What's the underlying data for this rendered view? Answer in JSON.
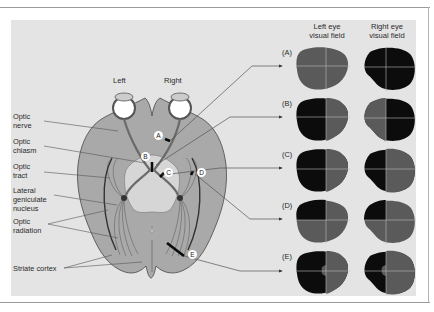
{
  "diagram": {
    "type": "visual pathway lesions and visual field defects",
    "side_labels": {
      "left": "Left",
      "right": "Right"
    },
    "column_headers": {
      "left_eye": "Left eye\nvisual field",
      "right_eye": "Right eye\nvisual field"
    },
    "structure_labels": [
      {
        "id": "optic-nerve",
        "text": "Optic\nnerve"
      },
      {
        "id": "optic-chiasm",
        "text": "Optic\nchiasm"
      },
      {
        "id": "optic-tract",
        "text": "Optic\ntract"
      },
      {
        "id": "lateral-geniculate-nucleus",
        "text": "Lateral\ngeniculate\nnucleus"
      },
      {
        "id": "optic-radiation",
        "text": "Optic\nradiation"
      },
      {
        "id": "striate-cortex",
        "text": "Striate cortex"
      }
    ],
    "lesion_markers": [
      "A",
      "B",
      "C",
      "D",
      "E"
    ],
    "rows": [
      {
        "label": "(A)",
        "left_eye": "fully gray (intact)",
        "right_eye": "fully black (blind)"
      },
      {
        "label": "(B)",
        "left_eye": "left half black, right half gray",
        "right_eye": "left half gray, right half black"
      },
      {
        "label": "(C)",
        "left_eye": "left half black, right half gray",
        "right_eye": "left half black, right half gray"
      },
      {
        "label": "(D)",
        "left_eye": "upper-left quadrant black",
        "right_eye": "upper-left quadrant black"
      },
      {
        "label": "(E)",
        "left_eye": "left half black with macular sparing",
        "right_eye": "left half black with macular sparing"
      }
    ],
    "colors": {
      "panel": "#e4e4e4",
      "brain": "#a9a9a9",
      "field_intact": "#5a5a5a",
      "field_blind": "#0c0c0c",
      "crosshair": "#b8b8b8",
      "lines": "#555555"
    }
  }
}
